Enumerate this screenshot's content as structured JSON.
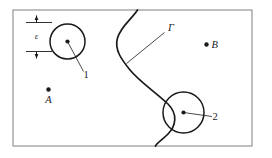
{
  "figure": {
    "type": "geometric-diagram",
    "background_color": "#ffffff",
    "stroke_color": "#1a1a1a",
    "frame_color": "#8a8a8a",
    "frame": {
      "x": 13,
      "y": 10,
      "width": 239,
      "height": 136,
      "stroke_width": 1.1
    },
    "curve": {
      "name": "gamma-curve",
      "label": "Γ",
      "label_x": 168,
      "label_y": 31,
      "path": "M 137.5 10 C 131 20, 121 26, 117.5 38 C 114 50, 122 60, 130 70 C 140 82, 153 90, 168 104 C 178 114, 176 126, 168 134 C 162 140, 157 143, 155.5 146",
      "stroke_width": 1.7,
      "leader": {
        "x1": 164.5,
        "y1": 32.5,
        "x2": 126.5,
        "y2": 63.5
      }
    },
    "circles": [
      {
        "name": "circle-1",
        "label": "1",
        "cx": 67.5,
        "cy": 41.5,
        "r": 17.5,
        "stroke_width": 1.5,
        "dot_r": 2.1,
        "label_x": 86,
        "label_y": 78,
        "leader": {
          "x1": 67.5,
          "y1": 41.5,
          "x2": 83.5,
          "y2": 71.5
        }
      },
      {
        "name": "circle-2",
        "label": "2",
        "cx": 183.5,
        "cy": 112.5,
        "r": 20.5,
        "stroke_width": 1.5,
        "dot_r": 2.1,
        "label_x": 215,
        "label_y": 120,
        "leader": {
          "x1": 183.5,
          "y1": 112.5,
          "x2": 212,
          "y2": 116.5
        }
      }
    ],
    "points": [
      {
        "name": "point-a",
        "label": "A",
        "dot_x": 48.5,
        "dot_y": 89.5,
        "dot_r": 2.2,
        "label_x": 48.5,
        "label_y": 103,
        "label_anchor": "middle"
      },
      {
        "name": "point-b",
        "label": "B",
        "dot_x": 206.5,
        "dot_y": 44.5,
        "dot_r": 2.2,
        "label_x": 211.5,
        "label_y": 48,
        "label_anchor": "start"
      }
    ],
    "dimension": {
      "name": "epsilon-dimension",
      "label": "ε",
      "label_x": 36.5,
      "label_y": 39,
      "line_x_start": 26,
      "line_x_end": 52,
      "top_y": 22.5,
      "bottom_y": 51.5,
      "arrow_x": 36.5,
      "arrow_top_tail_y": 15.5,
      "arrow_bottom_tail_y": 58.5,
      "stroke_width": 0.9
    },
    "font_sizes": {
      "label": 10.5,
      "number": 10.5,
      "epsilon": 8.5,
      "gamma": 10.5
    }
  }
}
